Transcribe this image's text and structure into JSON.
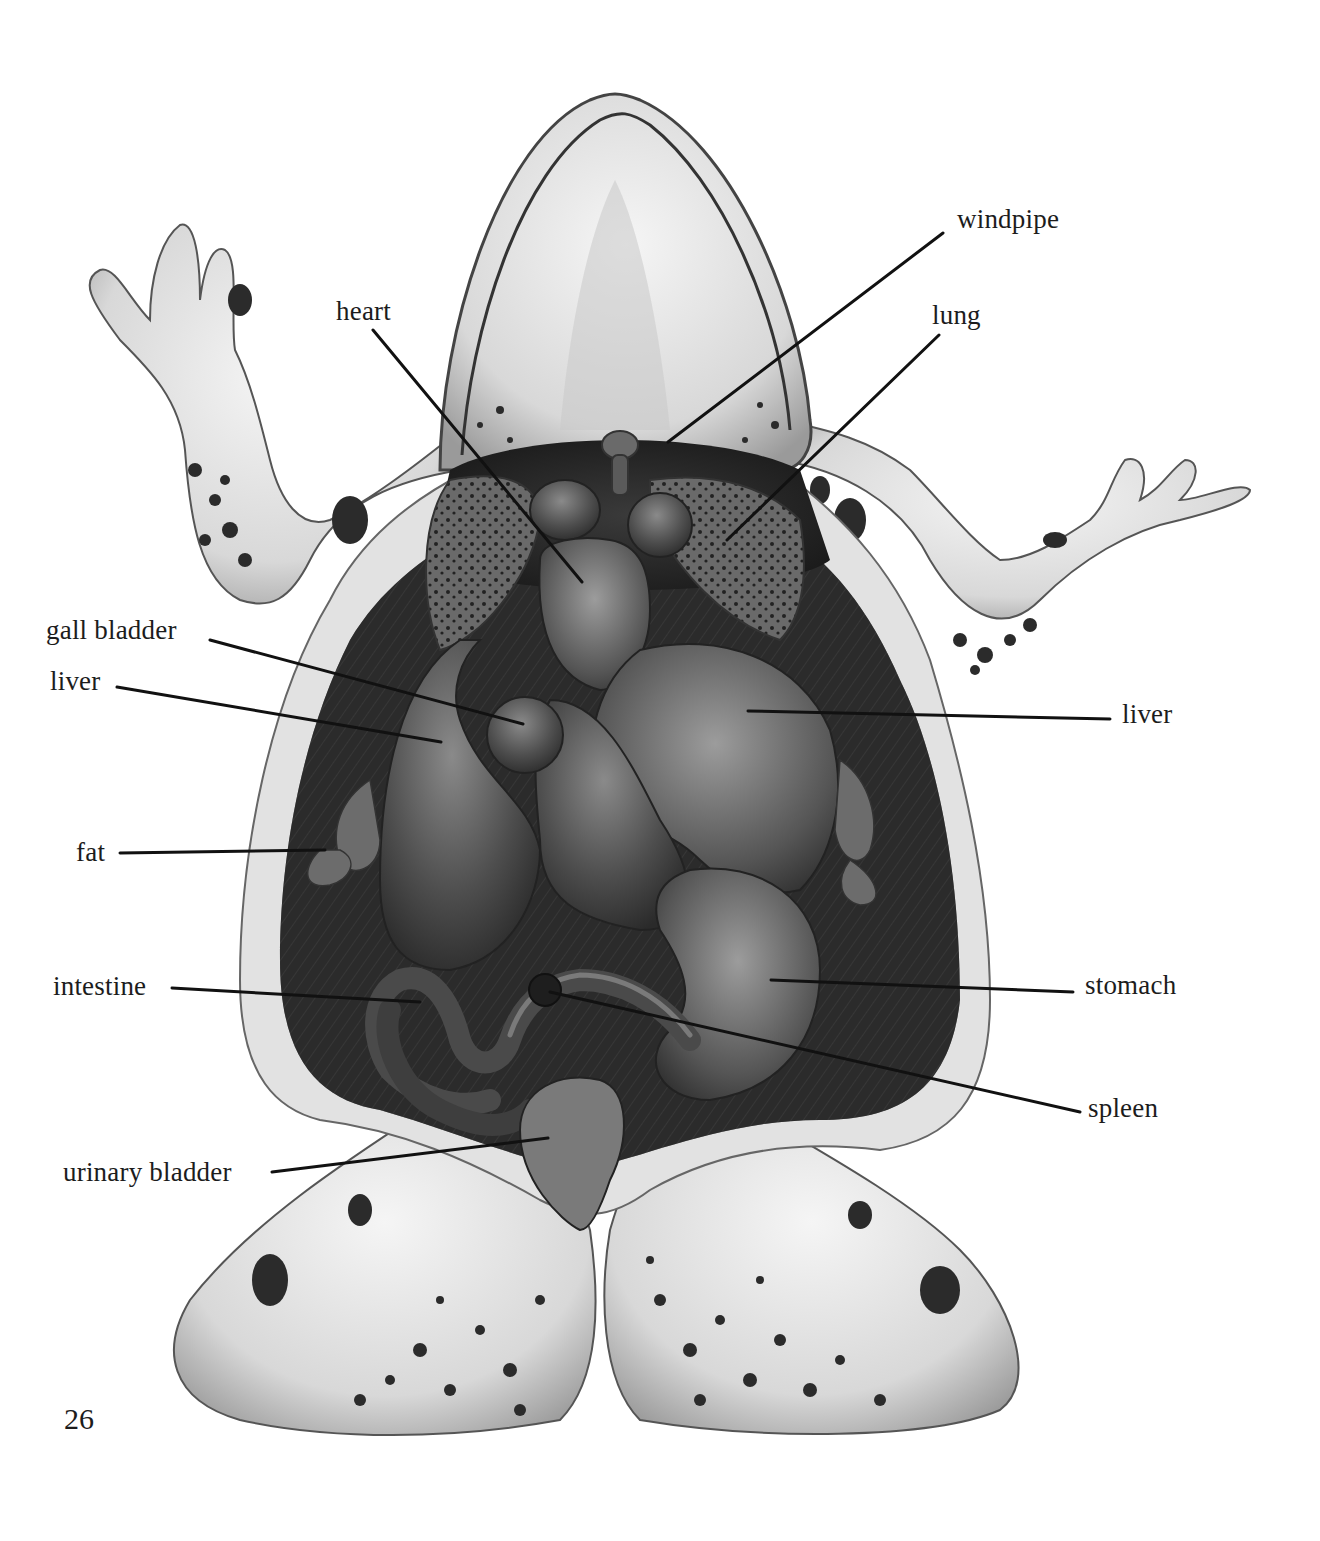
{
  "diagram": {
    "page_number": "26",
    "labels": [
      {
        "id": "heart",
        "text": "heart",
        "x": 336,
        "y": 296,
        "line": [
          373,
          330,
          582,
          582
        ]
      },
      {
        "id": "windpipe",
        "text": "windpipe",
        "x": 957,
        "y": 204,
        "line": [
          943,
          233,
          668,
          442
        ]
      },
      {
        "id": "lung",
        "text": "lung",
        "x": 932,
        "y": 300,
        "line": [
          939,
          335,
          727,
          540
        ]
      },
      {
        "id": "gall-bladder",
        "text": "gall bladder",
        "x": 46,
        "y": 615,
        "line": [
          210,
          640,
          523,
          724
        ]
      },
      {
        "id": "liver-left",
        "text": "liver",
        "x": 50,
        "y": 666,
        "line": [
          117,
          687,
          441,
          742
        ]
      },
      {
        "id": "liver-right",
        "text": "liver",
        "x": 1122,
        "y": 699,
        "line": [
          1110,
          719,
          748,
          711
        ]
      },
      {
        "id": "fat",
        "text": "fat",
        "x": 76,
        "y": 837,
        "line": [
          120,
          853,
          325,
          850
        ]
      },
      {
        "id": "intestine",
        "text": "intestine",
        "x": 53,
        "y": 971,
        "line": [
          172,
          988,
          420,
          1002
        ]
      },
      {
        "id": "stomach",
        "text": "stomach",
        "x": 1085,
        "y": 970,
        "line": [
          1073,
          992,
          771,
          980
        ]
      },
      {
        "id": "spleen",
        "text": "spleen",
        "x": 1088,
        "y": 1093,
        "line": [
          1080,
          1112,
          550,
          992
        ]
      },
      {
        "id": "urinary-bladder",
        "text": "urinary bladder",
        "x": 63,
        "y": 1157,
        "line": [
          272,
          1172,
          548,
          1138
        ]
      }
    ]
  },
  "colors": {
    "background": "#ffffff",
    "label_text": "#1c1c1c",
    "leader_line": "#111111",
    "skin_light": "#e6e6e6",
    "skin_mid": "#bdbdbd",
    "cavity_dark": "#2a2a2a",
    "organ_mid": "#4a4a4a",
    "spots": "#2b2b2b"
  }
}
